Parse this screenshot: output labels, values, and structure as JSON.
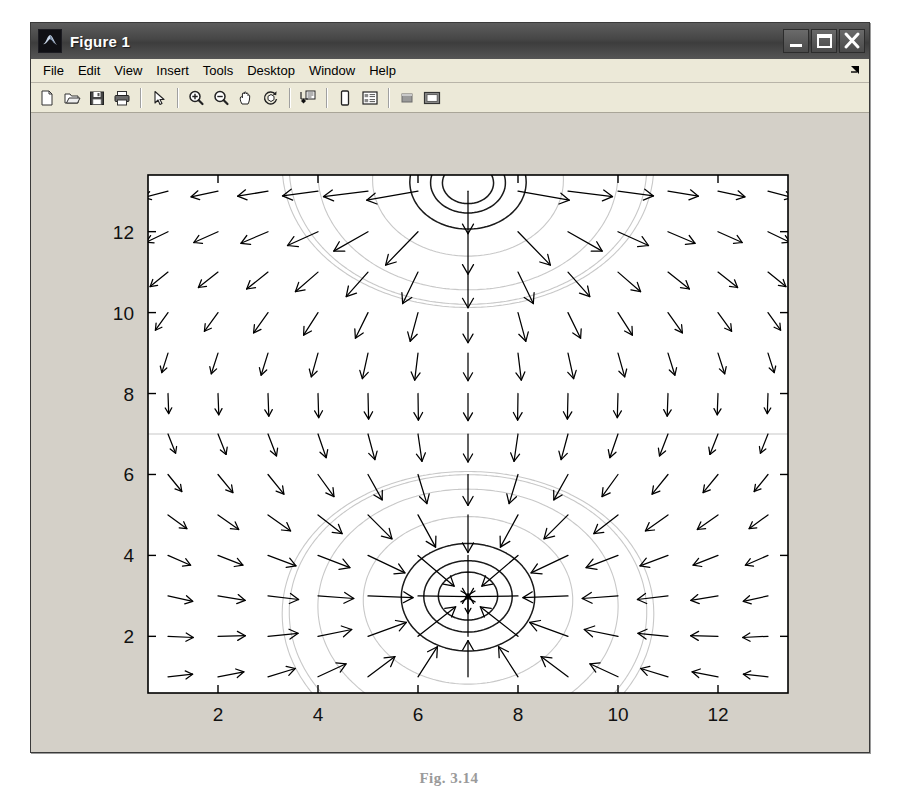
{
  "window": {
    "title": "Figure 1",
    "app_icon": "matlab-membrane-icon",
    "controls": [
      {
        "name": "minimize-button",
        "glyph": "minimize-icon"
      },
      {
        "name": "maximize-button",
        "glyph": "maximize-icon"
      },
      {
        "name": "close-button",
        "glyph": "close-icon"
      }
    ]
  },
  "menubar": {
    "items": [
      {
        "label": "File"
      },
      {
        "label": "Edit"
      },
      {
        "label": "View"
      },
      {
        "label": "Insert"
      },
      {
        "label": "Tools"
      },
      {
        "label": "Desktop"
      },
      {
        "label": "Window"
      },
      {
        "label": "Help"
      }
    ],
    "overflow_icon": "menu-overflow-arrow-icon"
  },
  "toolbar": {
    "buttons": [
      {
        "name": "new-figure-button",
        "icon": "new-document-icon",
        "tip": "New Figure"
      },
      {
        "name": "open-file-button",
        "icon": "open-folder-icon",
        "tip": "Open File"
      },
      {
        "name": "save-figure-button",
        "icon": "save-disk-icon",
        "tip": "Save Figure"
      },
      {
        "name": "print-figure-button",
        "icon": "printer-icon",
        "tip": "Print Figure"
      },
      {
        "name": "separator-1",
        "icon": "separator",
        "tip": ""
      },
      {
        "name": "edit-plot-button",
        "icon": "arrow-pointer-icon",
        "tip": "Edit Plot"
      },
      {
        "name": "separator-2",
        "icon": "separator",
        "tip": ""
      },
      {
        "name": "zoom-in-button",
        "icon": "zoom-in-icon",
        "tip": "Zoom In"
      },
      {
        "name": "zoom-out-button",
        "icon": "zoom-out-icon",
        "tip": "Zoom Out"
      },
      {
        "name": "pan-button",
        "icon": "hand-pan-icon",
        "tip": "Pan"
      },
      {
        "name": "rotate-3d-button",
        "icon": "rotate-3d-icon",
        "tip": "Rotate 3D"
      },
      {
        "name": "separator-3",
        "icon": "separator",
        "tip": ""
      },
      {
        "name": "data-cursor-button",
        "icon": "data-cursor-icon",
        "tip": "Data Cursor"
      },
      {
        "name": "separator-4",
        "icon": "separator",
        "tip": ""
      },
      {
        "name": "colorbar-button",
        "icon": "colorbar-icon",
        "tip": "Insert Colorbar"
      },
      {
        "name": "legend-button",
        "icon": "legend-icon",
        "tip": "Insert Legend"
      },
      {
        "name": "separator-5",
        "icon": "separator",
        "tip": ""
      },
      {
        "name": "hide-plot-tools-button",
        "icon": "hide-plot-tools-icon",
        "tip": "Hide Plot Tools"
      },
      {
        "name": "show-plot-tools-button",
        "icon": "show-plot-tools-icon",
        "tip": "Show Plot Tools and Dock Figure"
      }
    ]
  },
  "caption": {
    "text": "Fig. 3.14"
  },
  "colors": {
    "figure_background": "#d4d0c8",
    "axes_background": "#ffffff",
    "axes_line": "#000000",
    "contour_dark": "#1a1a1a",
    "contour_light": "#c8c8c8",
    "arrow": "#000000",
    "titlebar": "#464646",
    "menubar": "#ece9d8"
  },
  "chart_data": {
    "type": "scatter",
    "plot_kind": "quiver-over-contour",
    "title": "",
    "xlabel": "",
    "ylabel": "",
    "xlim": [
      0.6,
      13.4
    ],
    "ylim": [
      0.6,
      13.4
    ],
    "xticks": [
      2,
      4,
      6,
      8,
      10,
      12
    ],
    "yticks": [
      2,
      4,
      6,
      8,
      10,
      12
    ],
    "xticklabels": [
      "2",
      "4",
      "6",
      "8",
      "10",
      "12"
    ],
    "yticklabels": [
      "2",
      "4",
      "6",
      "8",
      "10",
      "12"
    ],
    "grid": false,
    "legend": "none",
    "box": true,
    "sources": [
      {
        "name": "source-lower",
        "x": 7.0,
        "y": 3.0,
        "sign": "outward"
      },
      {
        "name": "sink-upper",
        "x": 7.0,
        "y": 13.2,
        "sign": "inward"
      }
    ],
    "contour_levels_lower": [
      1.0,
      1.9,
      3.0,
      4.3,
      5.8
    ],
    "contour_levels_upper": [
      1.0,
      2.1,
      3.4,
      4.9,
      6.4
    ],
    "discontinuity_y": 7.0,
    "quiver_grid": {
      "x_start": 1,
      "x_step": 1,
      "x_count": 13,
      "y_start": 1,
      "y_step": 1,
      "y_count": 13
    }
  }
}
